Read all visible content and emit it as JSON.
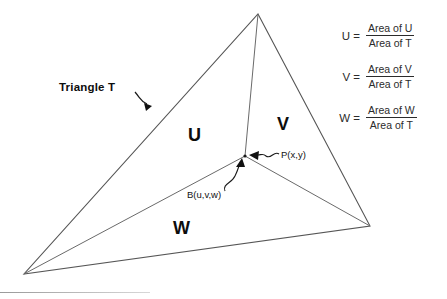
{
  "diagram": {
    "title_label": "Triangle T",
    "regions": [
      {
        "id": "U",
        "label": "U"
      },
      {
        "id": "V",
        "label": "V"
      },
      {
        "id": "W",
        "label": "W"
      }
    ],
    "points": [
      {
        "id": "P",
        "label": "P(x,y)"
      },
      {
        "id": "B",
        "label": "B(u,v,w)"
      }
    ],
    "geometry": {
      "apex": {
        "x": 258,
        "y": 14
      },
      "bottom_left": {
        "x": 24,
        "y": 274
      },
      "right": {
        "x": 370,
        "y": 226
      },
      "interior_point": {
        "x": 245,
        "y": 156
      }
    },
    "colors": {
      "stroke": "#555555",
      "text": "#0d0d0d",
      "formula_text": "#2b2b2b",
      "background": "#ffffff"
    }
  },
  "formulas": [
    {
      "lhs": "U =",
      "numerator": "Area of U",
      "denominator": "Area of T"
    },
    {
      "lhs": "V =",
      "numerator": "Area of V",
      "denominator": "Area of T"
    },
    {
      "lhs": "W =",
      "numerator": "Area of W",
      "denominator": "Area of T"
    }
  ]
}
